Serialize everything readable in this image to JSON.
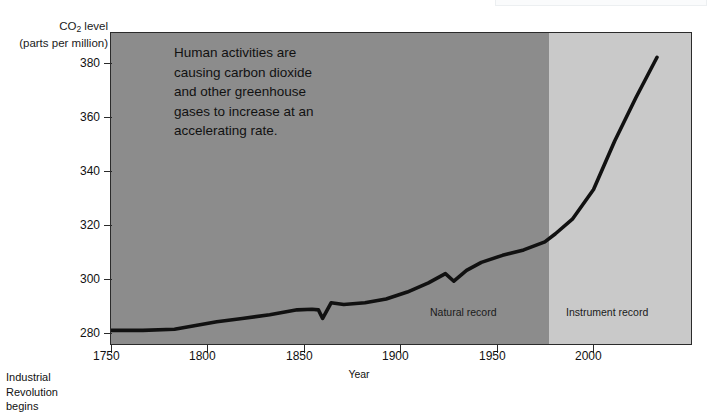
{
  "chart_data": {
    "type": "line",
    "title": "",
    "xlabel": "Year",
    "ylabel": "CO2 level (parts per million)",
    "ylabel_main": "CO",
    "ylabel_sub": "2",
    "ylabel_main_tail": " level",
    "ylabel_units": "(parts per million)",
    "xlim": [
      1750,
      2025
    ],
    "ylim": [
      272,
      388
    ],
    "grid": false,
    "legend": "none",
    "xticks": [
      1750,
      1800,
      1850,
      1900,
      1950,
      2000
    ],
    "xtick_labels": [
      "1750",
      "1800",
      "1850",
      "1900",
      "1950",
      "2000"
    ],
    "yticks": [
      280,
      300,
      320,
      340,
      360,
      380
    ],
    "ytick_labels": [
      "280",
      "300",
      "320",
      "340",
      "360",
      "380"
    ],
    "series": [
      {
        "name": "Atmospheric CO2 concentration",
        "color": "#111111",
        "x": [
          1750,
          1765,
          1780,
          1790,
          1800,
          1812,
          1825,
          1838,
          1845,
          1848,
          1850,
          1854,
          1860,
          1870,
          1880,
          1890,
          1900,
          1908,
          1912,
          1918,
          1925,
          1935,
          1945,
          1955,
          1960,
          1968,
          1978,
          1988,
          1998,
          2008
        ],
        "y": [
          277.8,
          277.8,
          278.2,
          279.6,
          281.0,
          282.2,
          283.6,
          285.4,
          285.6,
          285.4,
          282.2,
          288.0,
          287.4,
          288.0,
          289.4,
          292.0,
          295.4,
          298.8,
          296.0,
          300.0,
          303.0,
          305.6,
          307.6,
          310.6,
          313.6,
          319.0,
          330.0,
          348.0,
          364.0,
          379.0
        ]
      }
    ],
    "regions": [
      {
        "name": "natural-record",
        "label": "Natural record",
        "x_start": 1750,
        "x_end": 1957,
        "color": "#8c8c8c"
      },
      {
        "name": "instrument-record",
        "label": "Instrument record",
        "x_start": 1957,
        "x_end": 2025,
        "color": "#c9c9c9"
      }
    ],
    "annotations": [
      {
        "name": "human-activities-note",
        "text": "Human activities are\ncausing carbon dioxide\nand other greenhouse\ngases to increase at an\naccelerating rate."
      },
      {
        "name": "industrial-revolution-note",
        "text": "Industrial\nRevolution\nbegins",
        "points_to_year": 1775
      }
    ]
  },
  "axes": {
    "y_title_main": "CO",
    "y_title_sub": "2",
    "y_title_tail": " level",
    "y_title_units": "(parts per million)",
    "x_title": "Year"
  },
  "colors": {
    "natural_band": "#8c8c8c",
    "instrument_band": "#c9c9c9",
    "curve": "#111111",
    "axis": "#2b2b2b",
    "page_background": "#ffffff"
  }
}
